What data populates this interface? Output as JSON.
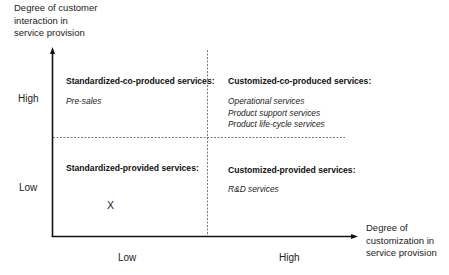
{
  "diagram": {
    "type": "2x2 matrix",
    "y_axis": {
      "title": "Degree of customer interaction in service provision",
      "title_lines": [
        "Degree of customer",
        "interaction in",
        "service provision"
      ],
      "ticks": {
        "high": "High",
        "low": "Low"
      }
    },
    "x_axis": {
      "title": "Degree of customization in service provision",
      "title_lines": [
        "Degree of",
        "customization in",
        "service provision"
      ],
      "ticks": {
        "low": "Low",
        "high": "High"
      }
    },
    "quadrants": {
      "top_left": {
        "title": "Standardized-co-produced services:",
        "items": [
          "Pre-sales"
        ]
      },
      "top_right": {
        "title": "Customized-co-produced services:",
        "items": [
          "Operational services",
          "Product support services",
          "Product life-cycle services"
        ]
      },
      "bottom_left": {
        "title": "Standardized-provided services:",
        "items": [],
        "marker": "X"
      },
      "bottom_right": {
        "title": "Customized-provided services:",
        "items": [
          "R&D services"
        ]
      }
    },
    "colors": {
      "axis": "#111111",
      "divider": "#555555",
      "background": "#ffffff"
    }
  }
}
